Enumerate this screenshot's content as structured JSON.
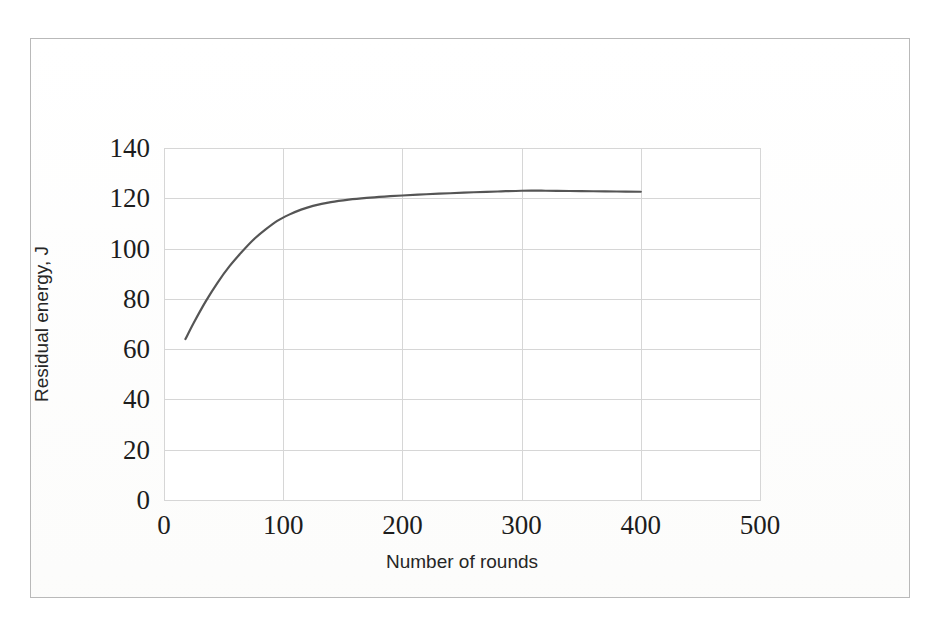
{
  "figure": {
    "background_color": "#ffffff",
    "frame_color": "#b9b9b9"
  },
  "chart_data": {
    "type": "line",
    "title": "",
    "subtitle": "",
    "xlabel": "Number of rounds",
    "ylabel": "Residual energy, J",
    "xlim": [
      0,
      500
    ],
    "ylim": [
      0,
      140
    ],
    "xticks": [
      "0",
      "100",
      "200",
      "300",
      "400",
      "500"
    ],
    "xtick_values": [
      0,
      100,
      200,
      300,
      400,
      500
    ],
    "yticks": [
      "0",
      "20",
      "40",
      "60",
      "80",
      "100",
      "120",
      "140"
    ],
    "ytick_values": [
      0,
      20,
      40,
      60,
      80,
      100,
      120,
      140
    ],
    "grid": true,
    "grid_color": "#d6d6d6",
    "legend": false,
    "legend_position": "none",
    "series": [
      {
        "name": "Residual energy",
        "color": "#555555",
        "line_width": 2.2,
        "marker": "none",
        "x": [
          18,
          25,
          35,
          45,
          55,
          65,
          75,
          85,
          95,
          105,
          115,
          125,
          140,
          155,
          170,
          185,
          200,
          220,
          240,
          260,
          280,
          300,
          320,
          340,
          360,
          380,
          400
        ],
        "values": [
          64,
          70.5,
          79,
          86.5,
          93,
          98.5,
          103.5,
          107.5,
          111,
          113.5,
          115.5,
          117,
          118.5,
          119.5,
          120.2,
          120.7,
          121.1,
          121.6,
          122,
          122.4,
          122.7,
          123,
          123,
          122.9,
          122.8,
          122.7,
          122.6
        ]
      }
    ],
    "annotations": []
  }
}
